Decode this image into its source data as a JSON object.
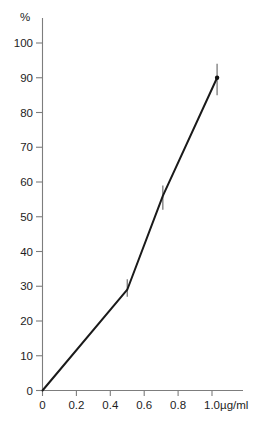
{
  "chart_data": {
    "type": "line",
    "title": "",
    "subtitle": "",
    "xlabel": "µg/ml",
    "ylabel": "%",
    "xlim": [
      0,
      1.1
    ],
    "ylim": [
      0,
      105
    ],
    "grid": false,
    "legend": false,
    "legend_position": "none",
    "x_ticks": [
      0,
      0.2,
      0.4,
      0.6,
      0.8,
      1.0
    ],
    "x_tick_labels": [
      "0",
      "0.2",
      "0.4",
      "0.6",
      "0.8",
      "1.0"
    ],
    "y_ticks": [
      0,
      10,
      20,
      30,
      40,
      50,
      60,
      70,
      80,
      90,
      100
    ],
    "y_tick_labels": [
      "0",
      "10",
      "20",
      "30",
      "40",
      "50",
      "60",
      "70",
      "80",
      "90",
      "100"
    ],
    "x": [
      0,
      0.5,
      0.71,
      1.03
    ],
    "values": [
      0,
      29,
      56,
      90
    ],
    "error_low": [
      0,
      27,
      52,
      85
    ],
    "error_high": [
      0,
      32,
      59,
      94
    ],
    "series": [
      {
        "name": "response",
        "x": [
          0,
          0.5,
          0.71,
          1.03
        ],
        "values": [
          0,
          29,
          56,
          90
        ],
        "error_low": [
          0,
          27,
          52,
          85
        ],
        "error_high": [
          0,
          32,
          59,
          94
        ]
      }
    ],
    "annotations": []
  },
  "axes": {
    "y_axis_unit_label": "%",
    "x_axis_unit_label": "µg/ml"
  },
  "colors": {
    "line": "#1a1a1a",
    "axis": "#7d7d7d",
    "error_bar": "#6e6e6e",
    "background": "#ffffff",
    "text": "#1d1d1d"
  }
}
